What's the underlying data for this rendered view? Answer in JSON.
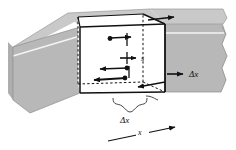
{
  "figure": {
    "name": "control-volume-in-bar-diagram",
    "background_color": "#ffffff",
    "ink_color": "#111111",
    "bar": {
      "name": "grey-bar",
      "front_face_color": "#b8b8b8",
      "top_face_color": "#c9c9c9",
      "end_face_color": "#aeaeae",
      "description": "long rectangular prism drawn in oblique projection, torn/jagged at the right end"
    },
    "element": {
      "name": "control-volume-cube",
      "face_color": "#ffffff",
      "edge_color": "#000000",
      "hidden_edge_style": "dashed",
      "description": "white cubic slice of the bar, visible edges solid, hidden edges dashed"
    },
    "labels": {
      "s": "s",
      "delta_x_right": "Δx",
      "delta_x_bottom": "Δx",
      "axis_x": "x"
    },
    "arrows": [
      {
        "name": "arrow-top-face-out",
        "direction": "right",
        "label": ""
      },
      {
        "name": "arrow-top-face-in",
        "direction": "right",
        "label": ""
      },
      {
        "name": "arrow-s-mid",
        "direction": "right",
        "label": "s"
      },
      {
        "name": "arrow-left-face-upper",
        "direction": "left",
        "label": ""
      },
      {
        "name": "arrow-left-face-lower",
        "direction": "left",
        "label": ""
      },
      {
        "name": "arrow-bottom-face",
        "direction": "left",
        "label": ""
      },
      {
        "name": "arrow-delta-x-right",
        "direction": "right",
        "label": "Δx"
      },
      {
        "name": "arrow-axis-x",
        "direction": "up-right",
        "label": "x"
      }
    ],
    "brace": {
      "name": "delta-x-brace",
      "description": "curly brace spanning the cube width along the bottom, annotated Δx"
    }
  }
}
